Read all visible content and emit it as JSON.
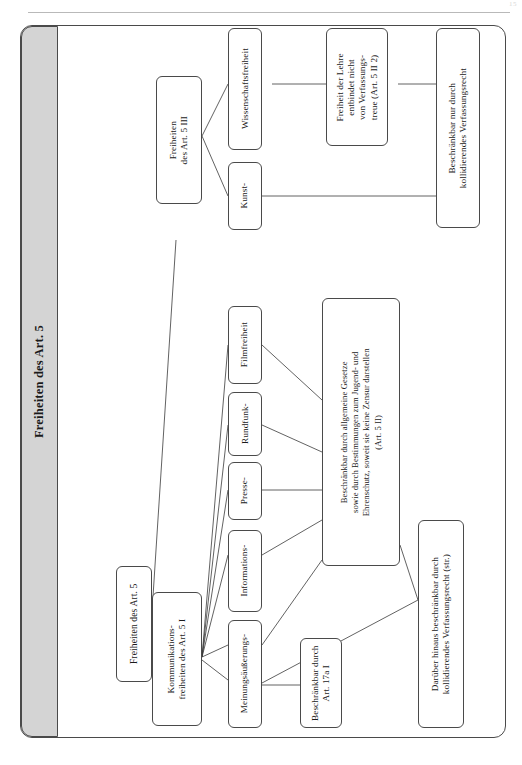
{
  "page": {
    "folio": "15",
    "title": "Freiheiten des Art. 5"
  },
  "diagram": {
    "type": "tree-diagram",
    "orientation": "rotated-90-ccw",
    "nodes": {
      "root": {
        "label": "Freiheiten des Art. 5"
      },
      "art5_3": {
        "label": "Freiheiten\ndes Art. 5 III"
      },
      "art5_1": {
        "label": "Kommunikations-\nfreiheiten des Art. 5 I"
      },
      "kunst": {
        "label": "Kunst-"
      },
      "wissenschaft": {
        "label": "Wissenschaftsfreiheit"
      },
      "lehre": {
        "label": "Freiheit der Lehre\nentbindet nicht\nvon Verfassungs-\ntreue (Art. 5 II 2)"
      },
      "nur_kollid": {
        "label": "Beschränkbar nur durch\nkollidierendes Verfassungsrecht"
      },
      "meinung": {
        "label": "Meinungsäußerungs-"
      },
      "information": {
        "label": "Informations-"
      },
      "presse": {
        "label": "Presse-"
      },
      "rundfunk": {
        "label": "Rundfunk-"
      },
      "film": {
        "label": "Filmfreiheit"
      },
      "art5_2": {
        "label": "Beschränkbar durch allgemeine Gesetze\nsowie durch Bestimmungen zum Jugend- und\nEhrenschutz, soweit sie keine Zensur darstellen\n(Art. 5 II)"
      },
      "art17a": {
        "label": "Beschränkbar durch\nArt. 17a I"
      },
      "darueber_hinaus": {
        "label": "Darüber hinaus beschränkbar durch\nkollidierendes Verfassungsrecht (str.)"
      }
    },
    "edges": [
      {
        "from": "root",
        "to": "art5_3"
      },
      {
        "from": "root",
        "to": "art5_1"
      },
      {
        "from": "art5_3",
        "to": "kunst"
      },
      {
        "from": "art5_3",
        "to": "wissenschaft"
      },
      {
        "from": "wissenschaft",
        "to": "lehre"
      },
      {
        "from": "lehre",
        "to": "nur_kollid"
      },
      {
        "from": "kunst",
        "to": "nur_kollid"
      },
      {
        "from": "art5_1",
        "to": "meinung"
      },
      {
        "from": "art5_1",
        "to": "information"
      },
      {
        "from": "art5_1",
        "to": "presse"
      },
      {
        "from": "art5_1",
        "to": "rundfunk"
      },
      {
        "from": "art5_1",
        "to": "film"
      },
      {
        "from": "meinung",
        "to": "art5_2"
      },
      {
        "from": "information",
        "to": "art5_2"
      },
      {
        "from": "presse",
        "to": "art5_2"
      },
      {
        "from": "rundfunk",
        "to": "art5_2"
      },
      {
        "from": "film",
        "to": "art5_2"
      },
      {
        "from": "meinung",
        "to": "art17a"
      },
      {
        "from": "meinung",
        "to": "darueber_hinaus"
      },
      {
        "from": "art5_2",
        "to": "darueber_hinaus"
      }
    ]
  },
  "colors": {
    "frame": "#4a4a4a",
    "title_band": "#d4d4d4",
    "line": "#3a3a3a",
    "text": "#1a1a1a",
    "page_bg": "#ffffff"
  }
}
